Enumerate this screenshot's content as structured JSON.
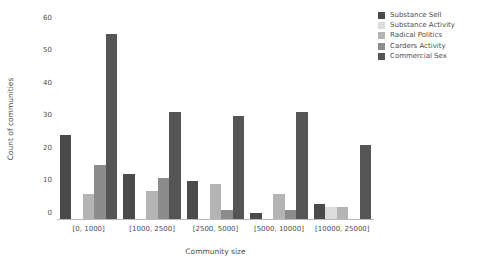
{
  "chart_data": {
    "type": "bar",
    "title": "",
    "xlabel": "Community size",
    "ylabel": "Count of communities",
    "categories": [
      "[0, 1000]",
      "[1000, 2500]",
      "[2500, 5000]",
      "[5000, 10000]",
      "[10000, 25000]"
    ],
    "series": [
      {
        "name": "Substance Sell",
        "color": "#4a4a4a",
        "values": [
          26,
          14,
          12,
          2,
          5
        ]
      },
      {
        "name": "Substance Activity",
        "color": "#dcdcdc",
        "values": [
          0,
          0,
          0,
          0,
          4
        ]
      },
      {
        "name": "Radical Politics",
        "color": "#b4b4b4",
        "values": [
          8,
          9,
          11,
          8,
          4
        ]
      },
      {
        "name": "Carders Activity",
        "color": "#8c8c8c",
        "values": [
          17,
          13,
          3,
          3,
          0
        ]
      },
      {
        "name": "Commercial Sex",
        "color": "#555555",
        "values": [
          57,
          33,
          32,
          33,
          23
        ]
      }
    ],
    "ylim": [
      0,
      62
    ],
    "yticks": [
      0,
      10,
      20,
      30,
      40,
      50,
      60
    ],
    "ytick_labels": [
      "0",
      "10",
      "20",
      "30",
      "40",
      "50",
      "60"
    ],
    "grid": false,
    "legend_position": "upper right"
  }
}
